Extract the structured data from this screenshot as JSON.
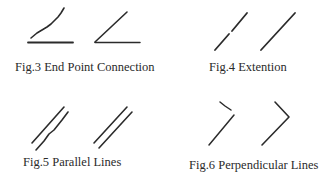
{
  "figures": [
    {
      "id": "fig3",
      "caption": "Fig.3 End Point Connection",
      "description": "Sketched stroke with gap from baseline (left) corrected to connected endpoints (right)"
    },
    {
      "id": "fig4",
      "caption": "Fig.4 Extention",
      "description": "Broken sketched line (left) corrected to a single continuous line (right)"
    },
    {
      "id": "fig5",
      "caption": "Fig.5 Parallel Lines",
      "description": "Roughly parallel sketched lines (left) corrected to exact parallel lines (right)"
    },
    {
      "id": "fig6",
      "caption": "Fig.6 Perpendicular Lines",
      "description": "Sketched corner (left) corrected to a perpendicular corner (right)"
    }
  ],
  "colors": {
    "stroke": "#2b2b2b",
    "text": "#2a2a2a",
    "background": "#ffffff"
  }
}
